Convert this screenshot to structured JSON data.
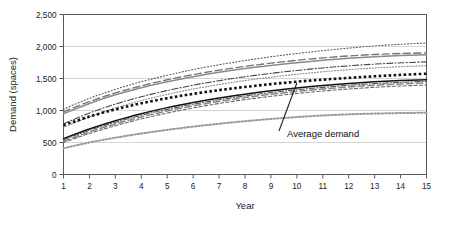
{
  "chart_data": {
    "type": "line",
    "title": "",
    "xlabel": "Year",
    "ylabel": "Demand (spaces)",
    "xlim": [
      1,
      15
    ],
    "ylim": [
      0,
      2500
    ],
    "grid": true,
    "legend": false,
    "x": [
      1,
      2,
      3,
      4,
      5,
      6,
      7,
      8,
      9,
      10,
      11,
      12,
      13,
      14,
      15
    ],
    "xtick_labels": [
      "1",
      "2",
      "3",
      "4",
      "5",
      "6",
      "7",
      "8",
      "9",
      "10",
      "11",
      "12",
      "13",
      "14",
      "15"
    ],
    "ytick_labels": [
      "0",
      "500",
      "1,000",
      "1,500",
      "2,000",
      "2,500"
    ],
    "ytick_values": [
      0,
      500,
      1000,
      1500,
      2000,
      2500
    ],
    "annotations": [
      {
        "text": "Average demand",
        "points_to_series": "Average demand",
        "points_to_x": 10,
        "points_to_y": 1430
      }
    ],
    "series": [
      {
        "name": "Scenario A (upper bound)",
        "style": "dotted",
        "color": "#555555",
        "width": 1.1,
        "values": [
          1020,
          1190,
          1330,
          1450,
          1550,
          1640,
          1715,
          1780,
          1840,
          1890,
          1935,
          1975,
          2010,
          2035,
          2055
        ]
      },
      {
        "name": "Scenario B",
        "style": "dashed-long",
        "color": "#777777",
        "width": 1.4,
        "values": [
          980,
          1140,
          1275,
          1385,
          1480,
          1560,
          1630,
          1690,
          1740,
          1785,
          1822,
          1852,
          1875,
          1890,
          1900
        ]
      },
      {
        "name": "Scenario C",
        "style": "solid",
        "color": "#8a8a8a",
        "width": 1.5,
        "values": [
          950,
          1110,
          1245,
          1355,
          1448,
          1528,
          1596,
          1655,
          1705,
          1748,
          1785,
          1815,
          1840,
          1858,
          1870
        ]
      },
      {
        "name": "Scenario D",
        "style": "dash-dot",
        "color": "#444444",
        "width": 1.1,
        "values": [
          790,
          960,
          1100,
          1215,
          1312,
          1395,
          1466,
          1528,
          1580,
          1626,
          1665,
          1698,
          1725,
          1745,
          1760
        ]
      },
      {
        "name": "Scenario E",
        "style": "dotted-fine",
        "color": "#666666",
        "width": 1.0,
        "values": [
          735,
          900,
          1040,
          1155,
          1252,
          1335,
          1406,
          1468,
          1520,
          1566,
          1605,
          1638,
          1665,
          1685,
          1700
        ]
      },
      {
        "name": "Average demand",
        "style": "square-dotted",
        "color": "#111111",
        "width": 2.6,
        "values": [
          770,
          905,
          1018,
          1112,
          1192,
          1260,
          1318,
          1368,
          1412,
          1450,
          1482,
          1510,
          1535,
          1556,
          1575
        ]
      },
      {
        "name": "Scenario F",
        "style": "solid-black",
        "color": "#111111",
        "width": 1.5,
        "values": [
          560,
          710,
          840,
          950,
          1045,
          1125,
          1195,
          1255,
          1308,
          1352,
          1390,
          1422,
          1448,
          1468,
          1482
        ]
      },
      {
        "name": "Scenario G",
        "style": "dash-dot-2",
        "color": "#555555",
        "width": 1.1,
        "values": [
          545,
          690,
          815,
          925,
          1018,
          1098,
          1168,
          1228,
          1280,
          1324,
          1362,
          1394,
          1420,
          1440,
          1455
        ]
      },
      {
        "name": "Scenario H",
        "style": "dashed-long-2",
        "color": "#888888",
        "width": 1.5,
        "values": [
          520,
          665,
          790,
          898,
          992,
          1072,
          1142,
          1202,
          1254,
          1298,
          1336,
          1368,
          1394,
          1414,
          1430
        ]
      },
      {
        "name": "Scenario I",
        "style": "dashed-short",
        "color": "#6a6a6a",
        "width": 1.1,
        "values": [
          500,
          640,
          762,
          868,
          960,
          1040,
          1110,
          1170,
          1222,
          1266,
          1304,
          1336,
          1362,
          1382,
          1398
        ]
      },
      {
        "name": "Scenario J (lower bound)",
        "style": "dotted-gray",
        "color": "#999999",
        "width": 2.0,
        "values": [
          410,
          500,
          575,
          640,
          697,
          748,
          793,
          833,
          868,
          898,
          922,
          940,
          952,
          960,
          965
        ]
      }
    ]
  }
}
